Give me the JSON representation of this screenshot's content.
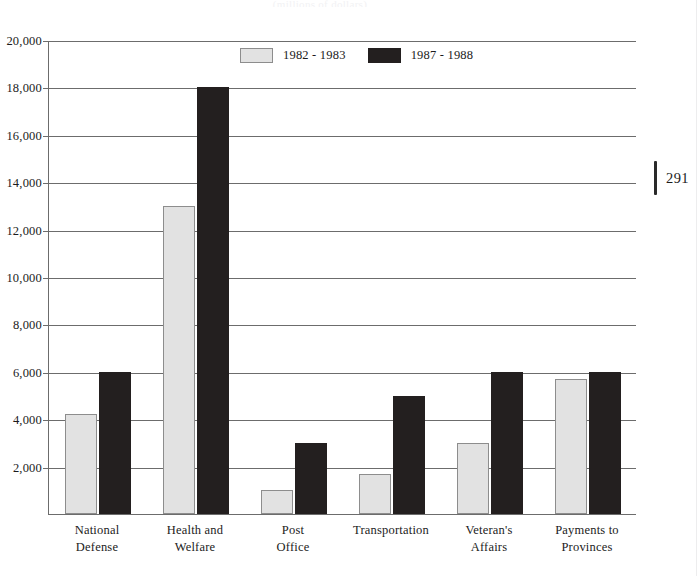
{
  "page": {
    "number": "291",
    "caption_top": "(millions of dollars)"
  },
  "chart_data": {
    "type": "bar",
    "title": "",
    "subtitle": "(millions of dollars)",
    "xlabel": "",
    "ylabel": "",
    "ylim": [
      0,
      20000
    ],
    "grid": true,
    "legend_position": "top-center",
    "categories": [
      "National Defense",
      "Health and Welfare",
      "Post Office",
      "Transportation",
      "Veteran's Affairs",
      "Payments to Provinces"
    ],
    "category_lines": [
      [
        "National",
        "Defense"
      ],
      [
        "Health and",
        "Welfare"
      ],
      [
        "Post",
        "Office"
      ],
      [
        "Transportation",
        ""
      ],
      [
        "Veteran's",
        "Affairs"
      ],
      [
        "Payments to",
        "Provinces"
      ]
    ],
    "ytick_labels": [
      "20,000",
      "18,000",
      "16,000",
      "14,000",
      "12,000",
      "10,000",
      "8,000",
      "6,000",
      "4,000",
      "2,000"
    ],
    "ytick_values": [
      20000,
      18000,
      16000,
      14000,
      12000,
      10000,
      8000,
      6000,
      4000,
      2000
    ],
    "series": [
      {
        "name": "1982 - 1983",
        "color": "#e2e2e2",
        "values": [
          4200,
          13000,
          1000,
          1700,
          3000,
          5700
        ]
      },
      {
        "name": "1987 - 1988",
        "color": "#231f1f",
        "values": [
          6000,
          18000,
          3000,
          5000,
          6000,
          6000
        ]
      }
    ]
  }
}
